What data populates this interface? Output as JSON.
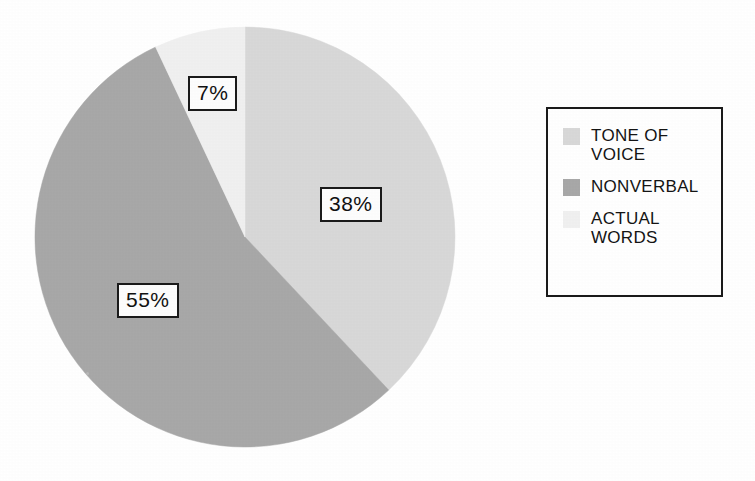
{
  "chart_data": {
    "type": "pie",
    "title": "",
    "subtitle": "",
    "categories": [
      "TONE OF VOICE",
      "NONVERBAL",
      "ACTUAL WORDS"
    ],
    "values": [
      38,
      55,
      7
    ],
    "value_labels": [
      "38%",
      "55%",
      "7%"
    ],
    "unit": "%",
    "total": 100,
    "start_angle_deg": 0,
    "direction": "clockwise",
    "legend_position": "right",
    "legend_border": true,
    "grid": false,
    "slice_colors": [
      "#d8d8d8",
      "#a8a8a8",
      "#f0f0f0"
    ],
    "slices": [
      {
        "label": "TONE OF VOICE",
        "value": 38,
        "value_label": "38%",
        "color": "#d8d8d8",
        "start_angle_deg": 0,
        "sweep_angle_deg": 136.8
      },
      {
        "label": "NONVERBAL",
        "value": 55,
        "value_label": "55%",
        "color": "#a8a8a8",
        "start_angle_deg": 136.8,
        "sweep_angle_deg": 198.0
      },
      {
        "label": "ACTUAL WORDS",
        "value": 7,
        "value_label": "7%",
        "color": "#f0f0f0",
        "start_angle_deg": 334.8,
        "sweep_angle_deg": 25.2
      }
    ]
  },
  "pie": {
    "labels": {
      "actual_words": "7%",
      "tone_of_voice": "38%",
      "nonverbal": "55%"
    }
  },
  "legend": {
    "items": [
      {
        "label": "TONE OF\nVOICE",
        "color": "#d8d8d8",
        "swatch_name": "legend-swatch-tone-of-voice"
      },
      {
        "label": "NONVERBAL",
        "color": "#a8a8a8",
        "swatch_name": "legend-swatch-nonverbal"
      },
      {
        "label": "ACTUAL\nWORDS",
        "color": "#f0f0f0",
        "swatch_name": "legend-swatch-actual-words"
      }
    ]
  },
  "colors": {
    "background": "#ffffff",
    "outline": "#1a1a1a",
    "text": "#141414",
    "tone_of_voice": "#d8d8d8",
    "nonverbal": "#a8a8a8",
    "actual_words": "#f0f0f0"
  }
}
